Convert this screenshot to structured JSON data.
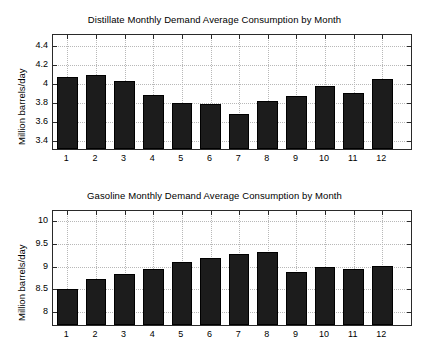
{
  "figure": {
    "background": "#ffffff",
    "bar_color": "#1c1c1c",
    "grid_color": "#b8b8b8",
    "axis_color": "#2a2a2a"
  },
  "chart_data": [
    {
      "type": "bar",
      "title": "Distillate Monthly Demand Average Consumption by Month",
      "xlabel": "",
      "ylabel": "Million barrels/day",
      "categories": [
        "1",
        "2",
        "3",
        "4",
        "5",
        "6",
        "7",
        "8",
        "9",
        "10",
        "11",
        "12"
      ],
      "values": [
        4.08,
        4.1,
        4.04,
        3.89,
        3.8,
        3.79,
        3.69,
        3.83,
        3.88,
        3.98,
        3.91,
        4.06
      ],
      "ylim": [
        3.32,
        4.52
      ],
      "yticks": [
        3.4,
        3.6,
        3.8,
        4.0,
        4.2,
        4.4
      ],
      "ytick_labels": [
        "3.4",
        "3.6",
        "3.8",
        "4",
        "4.2",
        "4.4"
      ],
      "xlim": [
        0.5,
        13.0
      ],
      "grid": true,
      "legend": "none"
    },
    {
      "type": "bar",
      "title": "Gasoline Monthly Demand Average Consumption by Month",
      "xlabel": "",
      "ylabel": "Million barrels/day",
      "categories": [
        "1",
        "2",
        "3",
        "4",
        "5",
        "6",
        "7",
        "8",
        "9",
        "10",
        "11",
        "12"
      ],
      "values": [
        8.52,
        8.72,
        8.84,
        8.95,
        9.11,
        9.2,
        9.27,
        9.31,
        8.89,
        9.0,
        8.94,
        9.02
      ],
      "ylim": [
        7.72,
        10.22
      ],
      "yticks": [
        8.0,
        8.5,
        9.0,
        9.5,
        10.0
      ],
      "ytick_labels": [
        "8",
        "8.5",
        "9",
        "9.5",
        "10"
      ],
      "xlim": [
        0.5,
        13.0
      ],
      "grid": true,
      "legend": "none"
    }
  ]
}
